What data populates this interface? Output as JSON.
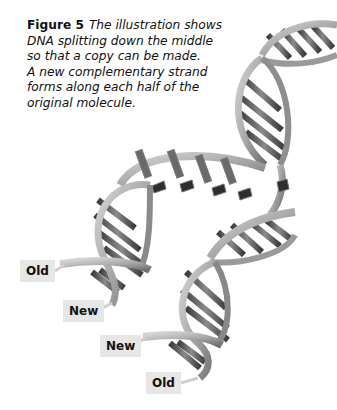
{
  "figure": {
    "label": "Figure 5",
    "caption_lines": [
      "The illustration shows",
      "DNA splitting down the middle",
      "so that a copy can be made.",
      "A new complementary strand",
      "forms along each half of the",
      "original molecule."
    ]
  },
  "illustration": {
    "subject": "DNA double helix unzipping during replication",
    "labels": [
      {
        "text": "Old",
        "strand": "left-original"
      },
      {
        "text": "New",
        "strand": "left-new"
      },
      {
        "text": "New",
        "strand": "right-new"
      },
      {
        "text": "Old",
        "strand": "right-original"
      }
    ],
    "colors": {
      "backbone_light": "#bdbdbd",
      "backbone_dark": "#7a7a7a",
      "base_pair_dark": "#4a4a4a",
      "label_bg": "#e6e6e6"
    }
  }
}
